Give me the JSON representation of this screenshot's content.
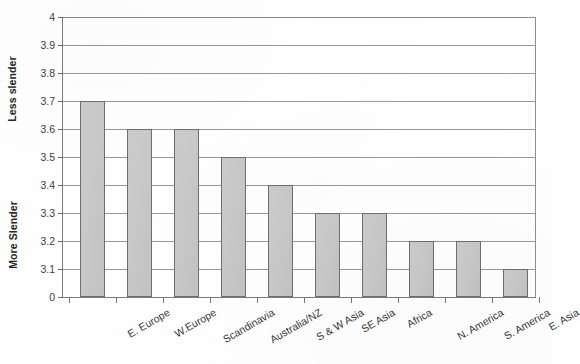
{
  "chart_data": {
    "type": "bar",
    "title": "",
    "xlabel": "",
    "ylabel": "",
    "categories": [
      "E. Europe",
      "W.Europe",
      "Scandinavia",
      "Australia/NZ",
      "S & W Asia",
      "SE Asia",
      "Africa",
      "N. America",
      "S. America",
      "E. Asia"
    ],
    "values": [
      3.7,
      3.6,
      3.6,
      3.5,
      3.4,
      3.3,
      3.3,
      3.2,
      3.2,
      3.1
    ],
    "ylim": [
      3.0,
      4.0
    ],
    "y_axis_broken": true,
    "y_tick_labels": [
      "4",
      "3.9",
      "3.8",
      "3.7",
      "3.6",
      "3.5",
      "3.4",
      "3.3",
      "3.2",
      "3.1",
      "0"
    ],
    "y_tick_values": [
      4,
      3.9,
      3.8,
      3.7,
      3.6,
      3.5,
      3.4,
      3.3,
      3.2,
      3.1,
      0
    ],
    "grid": true,
    "legend": false,
    "legend_position": "none",
    "axis_captions": {
      "upper": "Less slender",
      "lower": "More Slender"
    },
    "colors": {
      "bar_fill": "#c9c9c9",
      "bar_border": "#6e6e6e",
      "gridline": "#9a9a9a",
      "axis": "#7b7b7b",
      "text": "#333333",
      "background": "#ffffff"
    }
  }
}
